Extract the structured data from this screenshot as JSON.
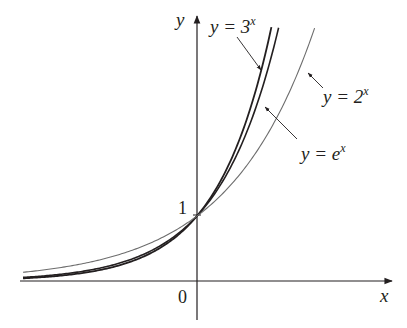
{
  "chart_data": {
    "type": "line",
    "title": "",
    "xlabel": "x",
    "ylabel": "y",
    "xlim": [
      -2.95,
      3.2
    ],
    "ylim": [
      -0.6,
      4.1
    ],
    "grid": false,
    "legend": "none (curves labeled directly with arrows)",
    "ticks": {
      "x": [
        {
          "value": 0,
          "label": "0"
        }
      ],
      "y": [
        {
          "value": 1,
          "label": "1"
        }
      ]
    },
    "series": [
      {
        "name": "y = 3^x",
        "base": 3,
        "label_base": "y = 3",
        "label_exp": "x",
        "stroke": "#231f20",
        "width": 1.8,
        "x": [
          -2.9,
          -2,
          -1,
          0,
          0.5,
          1,
          1.24
        ],
        "values": [
          0.041,
          0.111,
          0.333,
          1,
          1.732,
          3,
          3.9
        ]
      },
      {
        "name": "y = e^x",
        "base": 2.718281828,
        "label_base": "y = e",
        "label_exp": "x",
        "stroke": "#231f20",
        "width": 1.6,
        "x": [
          -2.9,
          -2,
          -1,
          0,
          0.5,
          1,
          1.36
        ],
        "values": [
          0.055,
          0.135,
          0.368,
          1,
          1.649,
          2.718,
          3.9
        ]
      },
      {
        "name": "y = 2^x",
        "base": 2,
        "label_base": "y = 2",
        "label_exp": "x",
        "stroke": "#6d6d6d",
        "width": 1.1,
        "x": [
          -2.9,
          -2,
          -1,
          0,
          0.5,
          1,
          1.96
        ],
        "values": [
          0.134,
          0.25,
          0.5,
          1,
          1.414,
          2,
          3.9
        ]
      }
    ],
    "annotations": [
      {
        "text": "y = 3^x",
        "points_to": "y = 3^x",
        "position": "top, left of curves"
      },
      {
        "text": "y = e^x",
        "points_to": "y = e^x",
        "position": "right, mid-height"
      },
      {
        "text": "y = 2^x",
        "points_to": "y = 2^x",
        "position": "right, upper"
      },
      {
        "text": "1",
        "at": [
          0,
          1
        ]
      },
      {
        "text": "0",
        "at": "origin"
      }
    ]
  },
  "axes": {
    "x_label": "x",
    "y_label": "y",
    "origin_label": "0",
    "y_tick_label": "1"
  },
  "labels": {
    "three": {
      "base": "y = 3",
      "exp": "x"
    },
    "e": {
      "base": "y = e",
      "exp": "x"
    },
    "two": {
      "base": "y = 2",
      "exp": "x"
    }
  }
}
